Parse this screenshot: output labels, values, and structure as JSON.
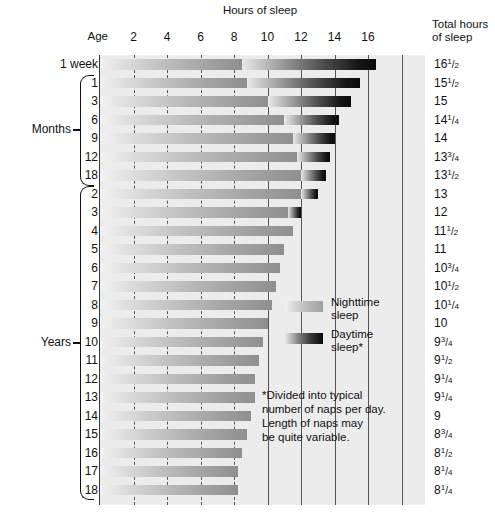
{
  "headers": {
    "hours_of_sleep": "Hours of sleep",
    "age": "Age",
    "total_hours": "Total hours\nof sleep"
  },
  "legend": {
    "nighttime_label": "Nighttime\nsleep",
    "daytime_label": "Daytime\nsleep*",
    "footnote": "*Divided into typical\nnumber of naps per day.\nLength of naps may\nbe quite variable."
  },
  "groups": [
    {
      "label": "Months",
      "first_row": 1,
      "last_row": 6
    },
    {
      "label": "Years",
      "first_row": 7,
      "last_row": 23
    }
  ],
  "chart_data": {
    "type": "bar",
    "title": "Hours of sleep",
    "xlabel": "Hours of sleep",
    "ylabel": "Age",
    "xlim": [
      0,
      19.4
    ],
    "xticks": [
      2,
      4,
      6,
      8,
      10,
      12,
      14,
      16
    ],
    "xtick_labels": [
      "2",
      "4",
      "6",
      "8",
      "10",
      "12",
      "14",
      "16"
    ],
    "grid": true,
    "legend_position": "inside-right",
    "stacked": true,
    "series": [
      {
        "name": "Nighttime sleep",
        "key": "night"
      },
      {
        "name": "Daytime sleep*",
        "key": "day"
      }
    ],
    "categories": [
      "1 week",
      "1",
      "3",
      "6",
      "9",
      "12",
      "18",
      "2",
      "3",
      "4",
      "5",
      "6",
      "7",
      "8",
      "9",
      "10",
      "11",
      "12",
      "13",
      "14",
      "15",
      "16",
      "17",
      "18"
    ],
    "rows": [
      {
        "age": "1 week",
        "night": 8.5,
        "day": 8.0,
        "total": 16.5,
        "total_text": "16|1|2"
      },
      {
        "age": "1",
        "night": 8.75,
        "day": 6.75,
        "total": 15.5,
        "total_text": "15|1|2"
      },
      {
        "age": "3",
        "night": 10.0,
        "day": 5.0,
        "total": 15.0,
        "total_text": "15"
      },
      {
        "age": "6",
        "night": 11.0,
        "day": 3.25,
        "total": 14.25,
        "total_text": "14|1|4"
      },
      {
        "age": "9",
        "night": 11.5,
        "day": 2.5,
        "total": 14.0,
        "total_text": "14"
      },
      {
        "age": "12",
        "night": 11.75,
        "day": 2.0,
        "total": 13.75,
        "total_text": "13|3|4"
      },
      {
        "age": "18",
        "night": 12.0,
        "day": 1.5,
        "total": 13.5,
        "total_text": "13|1|2"
      },
      {
        "age": "2",
        "night": 12.0,
        "day": 1.0,
        "total": 13.0,
        "total_text": "13"
      },
      {
        "age": "3",
        "night": 11.25,
        "day": 0.75,
        "total": 12.0,
        "total_text": "12"
      },
      {
        "age": "4",
        "night": 11.5,
        "day": 0.0,
        "total": 11.5,
        "total_text": "11|1|2"
      },
      {
        "age": "5",
        "night": 11.0,
        "day": 0.0,
        "total": 11.0,
        "total_text": "11"
      },
      {
        "age": "6",
        "night": 10.75,
        "day": 0.0,
        "total": 10.75,
        "total_text": "10|3|4"
      },
      {
        "age": "7",
        "night": 10.5,
        "day": 0.0,
        "total": 10.5,
        "total_text": "10|1|2"
      },
      {
        "age": "8",
        "night": 10.25,
        "day": 0.0,
        "total": 10.25,
        "total_text": "10|1|4"
      },
      {
        "age": "9",
        "night": 10.0,
        "day": 0.0,
        "total": 10.0,
        "total_text": "10"
      },
      {
        "age": "10",
        "night": 9.75,
        "day": 0.0,
        "total": 9.75,
        "total_text": "9|3|4"
      },
      {
        "age": "11",
        "night": 9.5,
        "day": 0.0,
        "total": 9.5,
        "total_text": "9|1|2"
      },
      {
        "age": "12",
        "night": 9.25,
        "day": 0.0,
        "total": 9.25,
        "total_text": "9|1|4"
      },
      {
        "age": "13",
        "night": 9.25,
        "day": 0.0,
        "total": 9.25,
        "total_text": "9|1|4"
      },
      {
        "age": "14",
        "night": 9.0,
        "day": 0.0,
        "total": 9.0,
        "total_text": "9"
      },
      {
        "age": "15",
        "night": 8.75,
        "day": 0.0,
        "total": 8.75,
        "total_text": "8|3|4"
      },
      {
        "age": "16",
        "night": 8.5,
        "day": 0.0,
        "total": 8.5,
        "total_text": "8|1|2"
      },
      {
        "age": "17",
        "night": 8.25,
        "day": 0.0,
        "total": 8.25,
        "total_text": "8|1|4"
      },
      {
        "age": "18",
        "night": 8.25,
        "day": 0.0,
        "total": 8.25,
        "total_text": "8|1|4"
      }
    ]
  },
  "colors": {
    "plot_background": "#ececec",
    "gridline": "#555555",
    "axis": "#3a3a3a",
    "text": "#111111"
  }
}
